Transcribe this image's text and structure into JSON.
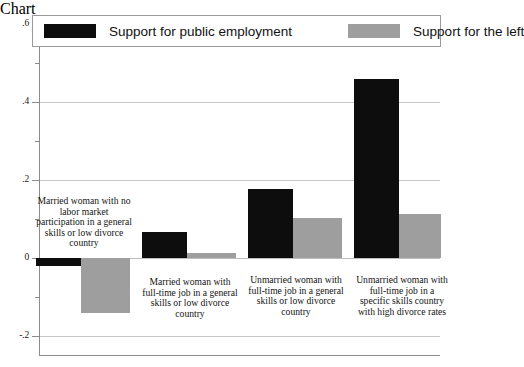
{
  "chart_data": {
    "type": "bar",
    "title": "",
    "subtitle": "",
    "xlabel": "",
    "ylabel": "",
    "ylim": [
      -0.2,
      0.62
    ],
    "grid": true,
    "grid_axis": "y",
    "legend_position": "top",
    "orientation": "vertical",
    "grouping": "grouped",
    "categories": [
      "Married woman with no labor market participation in a general skills or low divorce country",
      "Married woman with full-time job in a general skills or low divorce country",
      "Unmarried woman with full-time job in a general skills or low divorce country",
      "Unmarried woman with full-time job in a specific skills country with high divorce rates"
    ],
    "series": [
      {
        "name": "Support for public employment",
        "color": "#0d0d0d",
        "values": [
          -0.02,
          0.067,
          0.177,
          0.46
        ]
      },
      {
        "name": "Support for the left",
        "color": "#9e9e9e",
        "values": [
          -0.14,
          0.013,
          0.103,
          0.113
        ]
      }
    ],
    "yticks": [
      {
        "value": 0.6,
        "label": ".6"
      },
      {
        "value": 0.4,
        "label": ".4"
      },
      {
        "value": 0.2,
        "label": ".2"
      },
      {
        "value": 0.0,
        "label": "0"
      },
      {
        "value": -0.2,
        "label": "-.2"
      }
    ],
    "yticks_minor": [
      0.5,
      0.3,
      0.1,
      -0.1
    ]
  },
  "legend": {
    "items": [
      {
        "label": "Support for public employment",
        "color": "#0d0d0d"
      },
      {
        "label": "Support for the left",
        "color": "#9e9e9e"
      }
    ]
  },
  "axis": {
    "tick_labels": [
      ".6",
      ".4",
      ".2",
      "0",
      "-.2"
    ]
  }
}
